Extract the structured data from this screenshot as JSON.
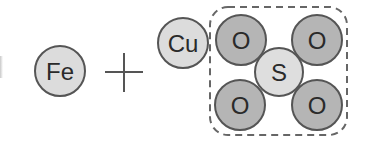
{
  "diagram": {
    "type": "chemical-reaction-particle-model",
    "colors": {
      "background": "#ffffff",
      "outline": "#555555",
      "light_atom_fill": "#dcdcdc",
      "dark_atom_fill": "#b5b5b5",
      "text": "#2a2a2a",
      "dashed_box": "#666666"
    },
    "reactants": [
      {
        "id": "fe",
        "label": "Fe",
        "cx": 60,
        "cy": 71,
        "r": 25,
        "fill": "light"
      },
      {
        "id": "cu",
        "label": "Cu",
        "cx": 183,
        "cy": 43,
        "r": 25,
        "fill": "light"
      }
    ],
    "operator": {
      "symbol": "+",
      "cx": 124,
      "cy": 72
    },
    "group": {
      "name": "sulfate-ion",
      "boundary": "dashed-rounded-rect",
      "atoms": [
        {
          "id": "o1",
          "label": "O",
          "cx": 241,
          "cy": 40,
          "r": 25,
          "fill": "dark"
        },
        {
          "id": "o2",
          "label": "O",
          "cx": 317,
          "cy": 40,
          "r": 25,
          "fill": "dark"
        },
        {
          "id": "o3",
          "label": "O",
          "cx": 240,
          "cy": 105,
          "r": 25,
          "fill": "dark"
        },
        {
          "id": "o4",
          "label": "O",
          "cx": 317,
          "cy": 105,
          "r": 25,
          "fill": "dark"
        },
        {
          "id": "s",
          "label": "S",
          "cx": 279,
          "cy": 72,
          "r": 24,
          "fill": "light"
        }
      ]
    }
  }
}
